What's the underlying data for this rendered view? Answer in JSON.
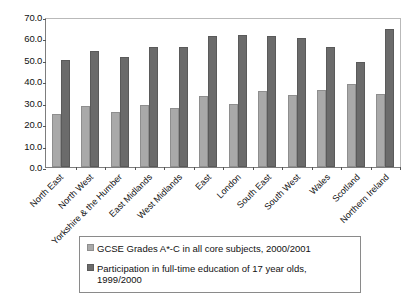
{
  "chart_data": {
    "type": "bar",
    "title": "",
    "xlabel": "",
    "ylabel": "",
    "ylim": [
      0,
      70
    ],
    "ytick_step": 10,
    "ytick_labels": [
      "0.0",
      "10.0",
      "20.0",
      "30.0",
      "40.0",
      "50.0",
      "60.0",
      "70.0"
    ],
    "grid": false,
    "legend_position": "bottom",
    "categories": [
      "North East",
      "North West",
      "Yorkshire & the Humber",
      "East Midlands",
      "West Midlands",
      "East",
      "London",
      "South East",
      "South West",
      "Wales",
      "Scotland",
      "Northern Ireland"
    ],
    "series": [
      {
        "name": "GCSE Grades A*-C in all core subjects, 2000/2001",
        "color": "#a9a9a9",
        "values": [
          24.8,
          28.5,
          25.9,
          29.1,
          27.5,
          33.0,
          29.2,
          35.5,
          33.5,
          36.0,
          38.9,
          34.3
        ]
      },
      {
        "name": "Participation in full-time education of 17 year olds, 1999/2000",
        "color": "#6b6b6b",
        "values": [
          50.0,
          54.2,
          51.5,
          56.1,
          55.9,
          61.0,
          61.8,
          61.1,
          60.4,
          56.1,
          48.9,
          64.4
        ]
      }
    ]
  },
  "legend": {
    "entries": [
      {
        "label": "GCSE Grades A*-C in all core subjects, 2000/2001"
      },
      {
        "label": "Participation in full-time education of 17 year olds, 1999/2000"
      }
    ]
  }
}
